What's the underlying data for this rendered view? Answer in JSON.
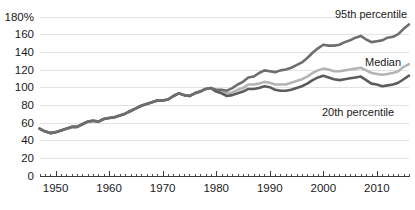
{
  "chart_data": {
    "type": "line",
    "title": "",
    "subtitle": "",
    "xlabel": "",
    "ylabel": "",
    "xlim": [
      1947,
      2016
    ],
    "ylim": [
      0,
      180
    ],
    "grid": true,
    "legend_position": "inline-right",
    "y_ticks": [
      "0",
      "20",
      "40",
      "60",
      "80",
      "100",
      "120",
      "140",
      "160",
      "180%"
    ],
    "y_tick_values": [
      0,
      20,
      40,
      60,
      80,
      100,
      120,
      140,
      160,
      180
    ],
    "x_ticks": [
      "1950",
      "1960",
      "1970",
      "1980",
      "1990",
      "2000",
      "2010"
    ],
    "x_tick_values": [
      1950,
      1960,
      1970,
      1980,
      1990,
      2000,
      2010
    ],
    "x_minor_step": 1,
    "colors": {
      "p95": "#6e6e6e",
      "median": "#b4b4b4",
      "p20": "#5c5c5c",
      "grid": "#e3e3e3",
      "axis": "#3a3a3a",
      "text": "#1a1a1a",
      "background": "#ffffff"
    },
    "x": [
      1947,
      1948,
      1949,
      1950,
      1951,
      1952,
      1953,
      1954,
      1955,
      1956,
      1957,
      1958,
      1959,
      1960,
      1961,
      1962,
      1963,
      1964,
      1965,
      1966,
      1967,
      1968,
      1969,
      1970,
      1971,
      1972,
      1973,
      1974,
      1975,
      1976,
      1977,
      1978,
      1979,
      1980,
      1981,
      1982,
      1983,
      1984,
      1985,
      1986,
      1987,
      1988,
      1989,
      1990,
      1991,
      1992,
      1993,
      1994,
      1995,
      1996,
      1997,
      1998,
      1999,
      2000,
      2001,
      2002,
      2003,
      2004,
      2005,
      2006,
      2007,
      2008,
      2009,
      2010,
      2011,
      2012,
      2013,
      2014,
      2015,
      2016
    ],
    "series": [
      {
        "name": "95th percentile",
        "label": "95th percentile",
        "color": "#6e6e6e",
        "values": [
          53,
          50,
          48,
          49,
          51,
          53,
          55,
          55,
          58,
          61,
          62,
          61,
          64,
          65,
          66,
          68,
          70,
          73,
          76,
          79,
          81,
          83,
          85,
          85,
          86,
          90,
          93,
          91,
          90,
          93,
          95,
          98,
          99,
          97,
          97,
          96,
          99,
          103,
          106,
          111,
          112,
          116,
          119,
          118,
          117,
          119,
          120,
          122,
          125,
          128,
          133,
          139,
          144,
          148,
          147,
          147,
          148,
          151,
          153,
          156,
          158,
          154,
          151,
          152,
          153,
          156,
          157,
          160,
          166,
          171
        ]
      },
      {
        "name": "Median",
        "label": "Median",
        "color": "#b4b4b4",
        "values": [
          53,
          50,
          48,
          49,
          51,
          53,
          55,
          55,
          58,
          61,
          62,
          61,
          64,
          65,
          66,
          68,
          70,
          73,
          76,
          79,
          81,
          83,
          85,
          85,
          86,
          90,
          93,
          91,
          90,
          93,
          95,
          98,
          99,
          96,
          95,
          93,
          94,
          97,
          99,
          103,
          103,
          104,
          106,
          105,
          103,
          103,
          103,
          105,
          107,
          109,
          112,
          116,
          119,
          121,
          120,
          118,
          118,
          119,
          120,
          121,
          122,
          119,
          116,
          115,
          114,
          115,
          116,
          118,
          123,
          126
        ]
      },
      {
        "name": "20th percentile",
        "label": "20th percentile",
        "color": "#5c5c5c",
        "values": [
          53,
          50,
          48,
          49,
          51,
          53,
          55,
          55,
          58,
          61,
          62,
          61,
          64,
          65,
          66,
          68,
          70,
          73,
          76,
          79,
          81,
          83,
          85,
          85,
          86,
          90,
          93,
          91,
          90,
          93,
          95,
          98,
          99,
          95,
          93,
          90,
          91,
          93,
          95,
          98,
          98,
          99,
          101,
          100,
          97,
          96,
          96,
          97,
          99,
          101,
          104,
          108,
          111,
          113,
          111,
          109,
          108,
          109,
          110,
          111,
          112,
          108,
          104,
          103,
          101,
          102,
          103,
          105,
          109,
          113
        ]
      }
    ],
    "annotations": [
      {
        "text": "95th percentile",
        "series": "p95",
        "x": 335,
        "y": 18
      },
      {
        "text": "Median",
        "series": "median",
        "x": 365,
        "y": 66
      },
      {
        "text": "20th percentile",
        "series": "p20",
        "x": 322,
        "y": 116
      }
    ]
  }
}
